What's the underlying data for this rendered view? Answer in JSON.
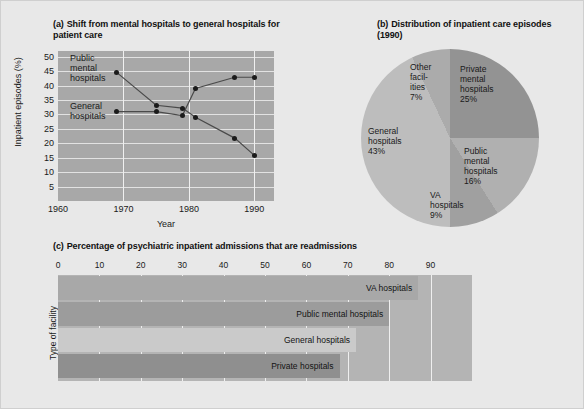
{
  "figure": {
    "background": "#e8e8e8",
    "plot_background_a": "#a8a8a8",
    "plot_background_c": "#b4b4b4"
  },
  "panel_a": {
    "tag": "(a)",
    "title": "Shift from mental hospitals to general hospitals for patient care",
    "xlabel": "Year",
    "ylabel": "Inpatient episodes (%)",
    "series_label_1": "Public mental hospitals",
    "series_label_2": "General hospitals"
  },
  "panel_b": {
    "tag": "(b)",
    "title": "Distribution of inpatient care episodes (1990)"
  },
  "panel_c": {
    "tag": "(c)",
    "title": "Percentage of psychiatric inpatient admissions that are readmissions",
    "ylabel": "Type of facility"
  },
  "chart_data": [
    {
      "type": "line",
      "panel": "(a)",
      "title": "Shift from mental hospitals to general hospitals for patient care",
      "xlabel": "Year",
      "ylabel": "Inpatient episodes (%)",
      "xlim": [
        1960,
        1993
      ],
      "ylim": [
        0,
        52
      ],
      "xticks": [
        1960,
        1970,
        1980,
        1990
      ],
      "yticks": [
        5,
        10,
        15,
        20,
        25,
        30,
        35,
        40,
        45,
        50
      ],
      "grid": true,
      "legend_position": "inline-annotations",
      "marker": "filled-circle",
      "marker_color": "#1b1b1b",
      "line_color": "#4a4a4a",
      "series": [
        {
          "name": "Public mental hospitals",
          "x": [
            1969,
            1975,
            1979,
            1981,
            1987,
            1990
          ],
          "values": [
            44.5,
            33.2,
            32.2,
            29.0,
            21.8,
            15.8
          ]
        },
        {
          "name": "General hospitals",
          "x": [
            1969,
            1975,
            1979,
            1981,
            1987,
            1990
          ],
          "values": [
            31.0,
            31.0,
            29.6,
            39.0,
            42.9,
            42.9
          ]
        }
      ]
    },
    {
      "type": "pie",
      "panel": "(b)",
      "title": "Distribution of inpatient care episodes (1990)",
      "start_angle_deg": 0,
      "direction": "clockwise",
      "slices": [
        {
          "label": "Private mental hospitals",
          "value": 25,
          "display": "25%",
          "color": "#939393"
        },
        {
          "label": "Public mental hospitals",
          "value": 16,
          "display": "16%",
          "color": "#b0b0b0"
        },
        {
          "label": "VA hospitals",
          "value": 9,
          "display": "9%",
          "color": "#a0a0a0"
        },
        {
          "label": "General hospitals",
          "value": 43,
          "display": "43%",
          "color": "#bdbdbd"
        },
        {
          "label": "Other facilities",
          "value": 7,
          "display": "7%",
          "color": "#ababab"
        }
      ]
    },
    {
      "type": "bar",
      "orientation": "horizontal",
      "panel": "(c)",
      "title": "Percentage of psychiatric inpatient admissions that are readmissions",
      "xlabel": "",
      "ylabel": "Type of facility",
      "xlim": [
        0,
        100
      ],
      "xticks": [
        0,
        10,
        20,
        30,
        40,
        50,
        60,
        70,
        80,
        90
      ],
      "grid": true,
      "categories": [
        "VA hospitals",
        "Public mental hospitals",
        "General hospitals",
        "Private hospitals"
      ],
      "values": [
        87,
        80,
        72,
        68
      ],
      "colors": [
        "#a8a8a8",
        "#9c9c9c",
        "#cacaca",
        "#8f8f8f"
      ]
    }
  ]
}
